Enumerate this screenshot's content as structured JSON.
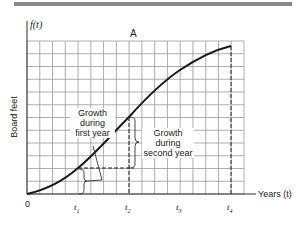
{
  "figure": {
    "panel_label": "A",
    "y_axis_function": "f(t)",
    "y_axis_label": "Board feet",
    "x_axis_label": "Years (t)",
    "origin_label": "0",
    "x_ticks": [
      "t1",
      "t2",
      "t3",
      "t4"
    ],
    "x_tick_display": [
      {
        "base": "t",
        "sub": "1"
      },
      {
        "base": "t",
        "sub": "2"
      },
      {
        "base": "t",
        "sub": "3"
      },
      {
        "base": "t",
        "sub": "4"
      }
    ],
    "annotations": {
      "first_year": [
        "Growth",
        "during",
        "first year"
      ],
      "second_year": [
        "Growth",
        "during",
        "second year"
      ]
    },
    "colors": {
      "grid": "#9a9a9a",
      "curve": "#1a1a1a",
      "top_bar": "#8a8a8a",
      "text": "#222222"
    }
  },
  "chart_data": {
    "type": "line",
    "title": "A",
    "xlabel": "Years (t)",
    "ylabel": "Board feet",
    "y_function": "f(t)",
    "x": [
      "0",
      "t1",
      "t2",
      "t3",
      "t4"
    ],
    "series": [
      {
        "name": "f(t) growth curve (sigmoid)",
        "values": [
          0,
          2,
          6,
          9.7,
          11.6
        ]
      }
    ],
    "grid": true,
    "grid_columns": 17,
    "grid_rows": 12,
    "ylim": [
      0,
      12
    ],
    "annotations": [
      {
        "text": "Growth during first year",
        "from": "0",
        "to": "t1"
      },
      {
        "text": "Growth during second year",
        "from": "t1",
        "to": "t2"
      }
    ]
  }
}
